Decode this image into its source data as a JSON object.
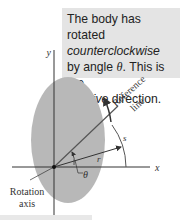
{
  "callout": {
    "line1": "The body has rotated",
    "line2": "counterclockwise",
    "line3a": "by angle ",
    "theta": "θ",
    "line3b": ". This is the",
    "line4a": "positive",
    "line4b": " direction."
  },
  "labels": {
    "y_axis": "y",
    "x_axis": "x",
    "reference_line_1": "Reference",
    "reference_line_2": "line",
    "arc_length": "s",
    "radius": "r",
    "angle": "θ",
    "rotation_axis_1": "Rotation",
    "rotation_axis_2": "axis"
  },
  "colors": {
    "body": "#b8b8b8",
    "callout_bg": "#e4e4e4",
    "line": "#333333"
  }
}
